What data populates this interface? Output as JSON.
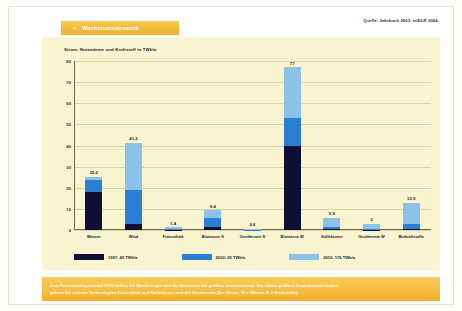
{
  "header": {
    "arrow_icon": "arrow-right-icon",
    "title": "Wachstumsdynamik",
    "source": "Quelle: Jahrbuch 2003, ni/DLR 2004."
  },
  "chart_data": {
    "type": "bar",
    "subtype": "stacked",
    "title": "Wachstumsdynamik",
    "ylabel": "Strom, Nutzwärme und Kraftstoff in TWh/a",
    "xlabel": "",
    "ylim": [
      0,
      80
    ],
    "yticks": [
      0,
      10,
      20,
      30,
      40,
      50,
      60,
      70,
      80
    ],
    "grid": true,
    "legend_position": "bottom",
    "categories": [
      "Wasser",
      "Wind",
      "Fotovoltaik",
      "Biomasse S",
      "Geothermie S",
      "Biomasse W",
      "Kollektoren",
      "Geothermie W",
      "Biokraftstoffe"
    ],
    "totals": [
      25.2,
      41.2,
      1.4,
      9.4,
      0.6,
      77.0,
      5.9,
      3.0,
      12.9
    ],
    "series": [
      {
        "name": "1997: 45 TWh/a",
        "color": "#0d1034",
        "values": [
          18.0,
          3.0,
          0.05,
          1.6,
          0.0,
          40.0,
          0.4,
          0.2,
          0.4
        ]
      },
      {
        "name": "2002: 65 TWh/a",
        "color": "#2a7fd4",
        "values": [
          5.5,
          16.0,
          0.25,
          4.2,
          0.15,
          13.0,
          1.1,
          0.5,
          2.6
        ]
      },
      {
        "name": "2010: 176 TWh/a",
        "color": "#8cc1e8",
        "values": [
          1.7,
          22.2,
          1.1,
          3.6,
          0.45,
          24.0,
          4.4,
          2.3,
          9.9
        ]
      }
    ]
  },
  "caption": {
    "line1": "Zum Fortschreitspotential 2010 liefern die Windenergie und die Biomasse die größten Zuwachsraten. Die relativ größten Zuwachsraten haben",
    "line2": "jedoch die solaren Technologien Fotovoltaik und Kollektoren und die Geothermie (S = Strom, W = Wärme, K = Kraftstoffe)."
  }
}
